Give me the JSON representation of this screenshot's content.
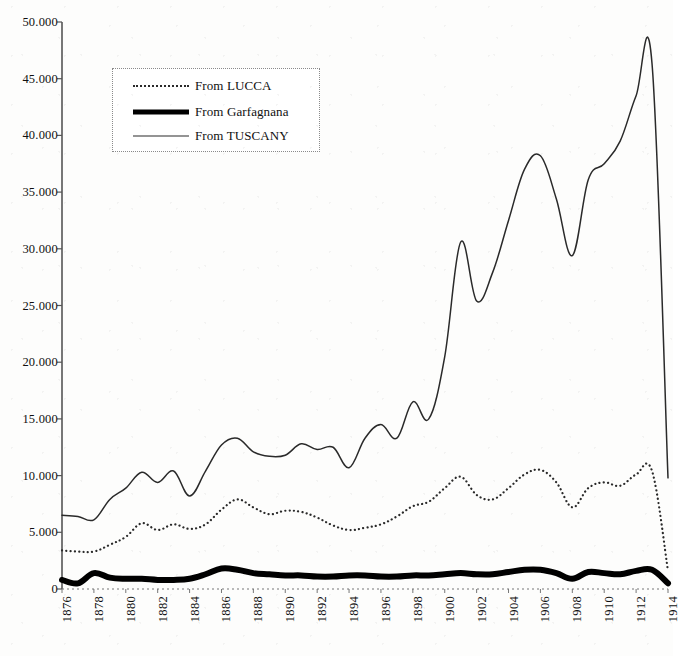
{
  "chart_data": {
    "type": "line",
    "title": "",
    "subtitle": "",
    "xlabel": "",
    "ylabel": "",
    "xlim": [
      1876,
      1914
    ],
    "ylim": [
      0,
      50000
    ],
    "grid": false,
    "legend_position": "top-left",
    "y_ticks": [
      "0",
      "5.000",
      "10.000",
      "15.000",
      "20.000",
      "25.000",
      "30.000",
      "35.000",
      "40.000",
      "45.000",
      "50.000"
    ],
    "y_tick_values": [
      0,
      5000,
      10000,
      15000,
      20000,
      25000,
      30000,
      35000,
      40000,
      45000,
      50000
    ],
    "x_ticks": [
      "1876",
      "1878",
      "1880",
      "1882",
      "1884",
      "1886",
      "1888",
      "1890",
      "1892",
      "1894",
      "1896",
      "1898",
      "1900",
      "1902",
      "1904",
      "1906",
      "1908",
      "1910",
      "1912",
      "1914"
    ],
    "x_tick_values": [
      1876,
      1878,
      1880,
      1882,
      1884,
      1886,
      1888,
      1890,
      1892,
      1894,
      1896,
      1898,
      1900,
      1902,
      1904,
      1906,
      1908,
      1910,
      1912,
      1914
    ],
    "x": [
      1876,
      1877,
      1878,
      1879,
      1880,
      1881,
      1882,
      1883,
      1884,
      1885,
      1886,
      1887,
      1888,
      1889,
      1890,
      1891,
      1892,
      1893,
      1894,
      1895,
      1896,
      1897,
      1898,
      1899,
      1900,
      1901,
      1902,
      1903,
      1904,
      1905,
      1906,
      1907,
      1908,
      1909,
      1910,
      1911,
      1912,
      1913,
      1914
    ],
    "series": [
      {
        "name": "From LUCCA",
        "style": "dotted",
        "color": "#2a2a2a",
        "width": 2.2,
        "values": [
          3400,
          3300,
          3300,
          3900,
          4600,
          5800,
          5200,
          5700,
          5300,
          5700,
          7000,
          7900,
          7200,
          6600,
          6900,
          6800,
          6300,
          5600,
          5200,
          5400,
          5700,
          6400,
          7300,
          7700,
          8900,
          9900,
          8300,
          7900,
          8900,
          10100,
          10500,
          9400,
          7200,
          8900,
          9400,
          9100,
          10100,
          10400,
          1600
        ]
      },
      {
        "name": "From Garfagnana",
        "style": "thick",
        "color": "#000000",
        "width": 6,
        "values": [
          800,
          500,
          1400,
          1000,
          900,
          900,
          800,
          800,
          900,
          1300,
          1800,
          1700,
          1400,
          1300,
          1200,
          1200,
          1100,
          1100,
          1200,
          1200,
          1100,
          1100,
          1200,
          1200,
          1300,
          1400,
          1300,
          1300,
          1500,
          1700,
          1700,
          1400,
          900,
          1500,
          1400,
          1300,
          1600,
          1700,
          500
        ]
      },
      {
        "name": "From TUSCANY",
        "style": "thin",
        "color": "#2a2a2a",
        "width": 1.5,
        "values": [
          6500,
          6400,
          6100,
          7900,
          8900,
          10300,
          9400,
          10400,
          8200,
          10400,
          12700,
          13300,
          12100,
          11700,
          11800,
          12800,
          12300,
          12500,
          10700,
          13300,
          14500,
          13300,
          16500,
          15000,
          20500,
          30600,
          25400,
          27900,
          32500,
          37000,
          38200,
          34400,
          29400,
          36100,
          37500,
          39500,
          43500,
          46300,
          9800
        ]
      }
    ],
    "annotations": []
  },
  "legend": {
    "items": [
      {
        "label": "From LUCCA",
        "swatch": "dotted-line-swatch"
      },
      {
        "label": "From Garfagnana",
        "swatch": "thick-line-swatch"
      },
      {
        "label": "From TUSCANY",
        "swatch": "thin-line-swatch"
      }
    ]
  },
  "axes": {
    "y_axis_name": "y-axis",
    "x_axis_name": "x-axis"
  }
}
